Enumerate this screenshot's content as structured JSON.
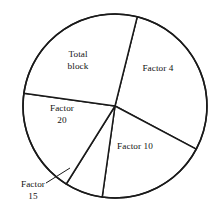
{
  "chart_data": {
    "type": "pie",
    "title": "",
    "subtitle": "",
    "xlabel": "",
    "ylabel": "",
    "grid": false,
    "legend_position": "none",
    "center": {
      "x": 115,
      "y": 106
    },
    "radius": 92,
    "note": "Angles measured in degrees clockwise, 0 = East (3 o'clock). Slice boundaries at -76, 28, 98, 122, 188, 284(=-76).",
    "categories": [
      "Factor 4",
      "Factor 10",
      "Factor 15",
      "Factor 20",
      "Total block"
    ],
    "values": [
      104,
      70,
      24,
      66,
      96
    ],
    "value_unit": "degrees",
    "percentages": [
      28.9,
      19.4,
      6.7,
      18.3,
      26.7
    ],
    "slices": [
      {
        "label": "Factor 4",
        "start_angle": -76,
        "end_angle": 28,
        "sweep": 104,
        "percent": 28.9,
        "label_placement": "inside",
        "label_x": 158,
        "label_y": 70,
        "label_text": "Factor 4"
      },
      {
        "label": "Factor 10",
        "start_angle": 28,
        "end_angle": 98,
        "sweep": 70,
        "percent": 19.4,
        "label_placement": "inside",
        "label_x": 135,
        "label_y": 148,
        "label_text": "Factor 10"
      },
      {
        "label": "Factor 15",
        "start_angle": 98,
        "end_angle": 122,
        "sweep": 24,
        "percent": 6.7,
        "label_placement": "outside-with-leader",
        "label_x": 33,
        "label_y": 186,
        "label_text": "Factor\n15"
      },
      {
        "label": "Factor 20",
        "start_angle": 122,
        "end_angle": 188,
        "sweep": 66,
        "percent": 18.3,
        "label_placement": "inside",
        "label_x": 62,
        "label_y": 110,
        "label_text": "Factor\n20"
      },
      {
        "label": "Total block",
        "start_angle": 188,
        "end_angle": 284,
        "sweep": 96,
        "percent": 26.7,
        "label_placement": "inside",
        "label_x": 78,
        "label_y": 56,
        "label_text": "Total\nblock"
      }
    ],
    "leader": {
      "from_x": 70,
      "from_y": 168,
      "to_x": 46,
      "to_y": 183
    },
    "colors": {
      "slice_fill": "#ffffff",
      "stroke": "#1a1a1a",
      "label_text": "#111111",
      "background": "#ffffff"
    }
  },
  "labels": {
    "factor4": "Factor 4",
    "factor10": "Factor 10",
    "factor15": "Factor\n15",
    "factor20": "Factor\n20",
    "total_block": "Total\nblock"
  }
}
